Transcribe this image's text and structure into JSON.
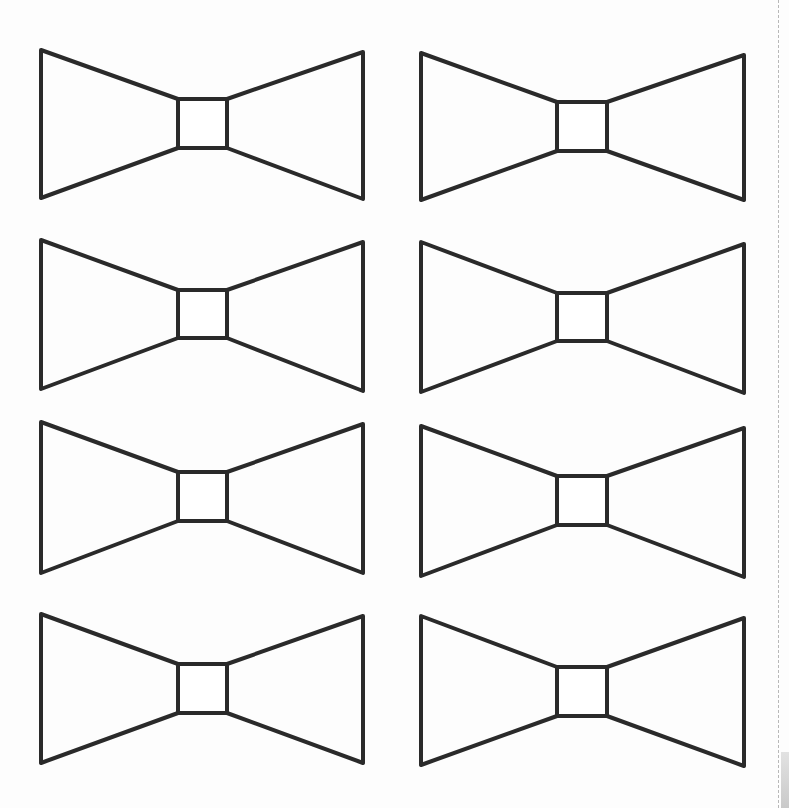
{
  "page": {
    "title": "Bow tie cut-out template",
    "background": "#fdfdfd",
    "stroke_color": "#2a2a2a",
    "cut_line_color": "#b8b8b8"
  },
  "template": {
    "shape": "bow-tie",
    "count": 8,
    "layout": "4 rows x 2 columns",
    "bows": [
      {
        "id": "bow-1",
        "row": 1,
        "col": 1,
        "x": 41,
        "y": 50,
        "knot": {
          "x": 178,
          "y": 99,
          "w": 49,
          "h": 49
        },
        "left_wing": [
          50,
          198
        ],
        "right_x": 363,
        "right_wing": [
          52,
          199
        ]
      },
      {
        "id": "bow-2",
        "row": 1,
        "col": 2,
        "x": 421,
        "y": 53,
        "knot": {
          "x": 557,
          "y": 102,
          "w": 50,
          "h": 49
        },
        "left_wing": [
          53,
          200
        ],
        "right_x": 744,
        "right_wing": [
          55,
          200
        ]
      },
      {
        "id": "bow-3",
        "row": 2,
        "col": 1,
        "x": 41,
        "y": 240,
        "knot": {
          "x": 178,
          "y": 290,
          "w": 49,
          "h": 48
        },
        "left_wing": [
          240,
          389
        ],
        "right_x": 363,
        "right_wing": [
          242,
          391
        ]
      },
      {
        "id": "bow-4",
        "row": 2,
        "col": 2,
        "x": 421,
        "y": 242,
        "knot": {
          "x": 557,
          "y": 293,
          "w": 50,
          "h": 48
        },
        "left_wing": [
          242,
          392
        ],
        "right_x": 744,
        "right_wing": [
          244,
          393
        ]
      },
      {
        "id": "bow-5",
        "row": 3,
        "col": 1,
        "x": 41,
        "y": 422,
        "knot": {
          "x": 178,
          "y": 472,
          "w": 49,
          "h": 49
        },
        "left_wing": [
          422,
          573
        ],
        "right_x": 363,
        "right_wing": [
          424,
          573
        ]
      },
      {
        "id": "bow-6",
        "row": 3,
        "col": 2,
        "x": 421,
        "y": 426,
        "knot": {
          "x": 557,
          "y": 476,
          "w": 50,
          "h": 49
        },
        "left_wing": [
          426,
          576
        ],
        "right_x": 744,
        "right_wing": [
          428,
          577
        ]
      },
      {
        "id": "bow-7",
        "row": 4,
        "col": 1,
        "x": 41,
        "y": 614,
        "knot": {
          "x": 178,
          "y": 664,
          "w": 49,
          "h": 49
        },
        "left_wing": [
          614,
          763
        ],
        "right_x": 363,
        "right_wing": [
          616,
          763
        ]
      },
      {
        "id": "bow-8",
        "row": 4,
        "col": 2,
        "x": 421,
        "y": 616,
        "knot": {
          "x": 557,
          "y": 667,
          "w": 50,
          "h": 49
        },
        "left_wing": [
          616,
          765
        ],
        "right_x": 744,
        "right_wing": [
          618,
          766
        ]
      }
    ]
  }
}
